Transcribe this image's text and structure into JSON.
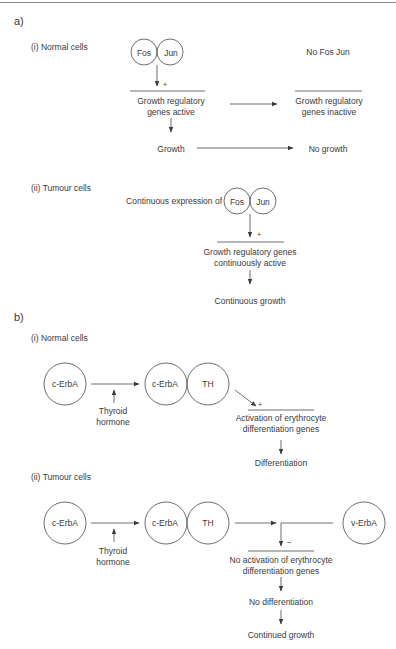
{
  "panel_a": {
    "label": "a)",
    "normal": {
      "heading": "(i) Normal cells",
      "left": {
        "complex": [
          "Fos",
          "Jun"
        ],
        "effect_sign": "+",
        "genes_line1": "Growth regulatory",
        "genes_line2": "genes active",
        "outcome": "Growth"
      },
      "right": {
        "condition": "No Fos Jun",
        "genes_line1": "Growth regulatory",
        "genes_line2": "genes inactive",
        "outcome": "No growth"
      }
    },
    "tumour": {
      "heading": "(ii) Tumour cells",
      "prefix": "Continuous expression of",
      "complex": [
        "Fos",
        "Jun"
      ],
      "effect_sign": "+",
      "genes_line1": "Growth regulatory genes",
      "genes_line2": "continuously active",
      "outcome": "Continuous growth"
    }
  },
  "panel_b": {
    "label": "b)",
    "normal": {
      "heading": "(i) Normal cells",
      "receptor": "c-ErbA",
      "ligand_line1": "Thyroid",
      "ligand_line2": "hormone",
      "complex": [
        "c-ErbA",
        "TH"
      ],
      "effect_sign": "+",
      "genes_line1": "Activation of erythrocyte",
      "genes_line2": "differentiation genes",
      "outcome": "Differentiation"
    },
    "tumour": {
      "heading": "(ii) Tumour cells",
      "receptor": "c-ErbA",
      "ligand_line1": "Thyroid",
      "ligand_line2": "hormone",
      "complex": [
        "c-ErbA",
        "TH"
      ],
      "inhibitor": "v-ErbA",
      "effect_sign": "−",
      "genes_line1": "No activation of erythrocyte",
      "genes_line2": "differentiation genes",
      "outcome1": "No differentiation",
      "outcome2": "Continued growth"
    }
  }
}
